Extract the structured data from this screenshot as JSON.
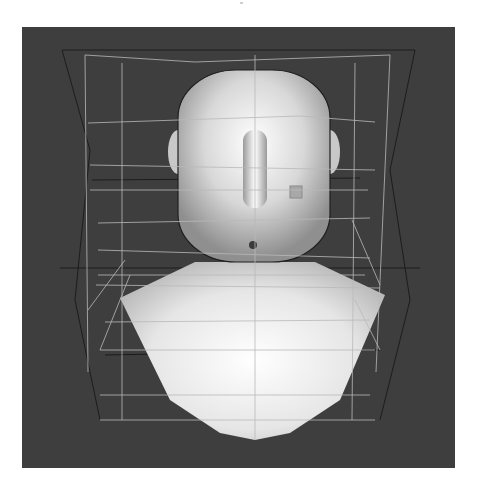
{
  "viewport": {
    "background": "#3e3e3e",
    "bounds": {
      "x": 22,
      "y": 27,
      "width": 433,
      "height": 441
    }
  },
  "colors": {
    "lattice_light": "#b9b9b9",
    "lattice_dark": "#1c1c1c",
    "mesh_light": "#f6f6f6",
    "mesh_mid": "#cfcfcf",
    "mesh_shadow": "#8e8e8e",
    "marker_point": "#3a3a3a",
    "marker_square": "#a8a8a8"
  },
  "model": {
    "name": "bust",
    "head": {
      "cx": 255,
      "top": 70,
      "bottom": 262,
      "left": 178,
      "right": 330
    },
    "ears": [
      {
        "side": "left",
        "cx": 178,
        "cy": 152,
        "rx": 10,
        "ry": 22
      },
      {
        "side": "right",
        "cx": 330,
        "cy": 152,
        "rx": 10,
        "ry": 22
      }
    ],
    "nose": {
      "x": 243,
      "y": 130,
      "width": 24,
      "height": 78
    },
    "chin_marker": {
      "cx": 253,
      "cy": 245,
      "r": 4
    },
    "cheek_square": {
      "x": 290,
      "y": 186,
      "size": 12
    },
    "torso_points": "120,298 195,262 315,262 385,295 340,400 290,433 255,440 220,433 170,400"
  },
  "lattice": {
    "light_lines": [
      [
        85,
        55,
        195,
        62
      ],
      [
        195,
        62,
        390,
        55
      ],
      [
        85,
        55,
        88,
        372
      ],
      [
        390,
        55,
        376,
        372
      ],
      [
        122,
        63,
        122,
        420
      ],
      [
        355,
        63,
        352,
        420
      ],
      [
        88,
        123,
        300,
        116
      ],
      [
        300,
        116,
        375,
        122
      ],
      [
        90,
        165,
        375,
        170
      ],
      [
        90,
        190,
        368,
        190
      ],
      [
        98,
        223,
        370,
        218
      ],
      [
        98,
        250,
        370,
        258
      ],
      [
        98,
        275,
        365,
        275
      ],
      [
        96,
        285,
        380,
        288
      ],
      [
        105,
        322,
        370,
        320
      ],
      [
        100,
        350,
        375,
        350
      ],
      [
        100,
        395,
        370,
        395
      ],
      [
        100,
        420,
        375,
        420
      ],
      [
        88,
        310,
        125,
        260
      ],
      [
        100,
        350,
        130,
        275
      ],
      [
        352,
        220,
        380,
        285
      ],
      [
        355,
        300,
        380,
        350
      ],
      [
        255,
        55,
        255,
        440
      ]
    ],
    "dark_lines": [
      [
        62,
        50,
        415,
        50
      ],
      [
        62,
        50,
        90,
        150
      ],
      [
        90,
        150,
        75,
        300
      ],
      [
        75,
        300,
        100,
        420
      ],
      [
        415,
        50,
        390,
        170
      ],
      [
        390,
        170,
        410,
        300
      ],
      [
        410,
        300,
        380,
        420
      ],
      [
        92,
        180,
        360,
        178
      ],
      [
        60,
        268,
        420,
        268
      ],
      [
        105,
        355,
        380,
        350
      ]
    ]
  },
  "controls": {
    "top_tick": {
      "x": 240,
      "y": 3,
      "label": ""
    }
  }
}
